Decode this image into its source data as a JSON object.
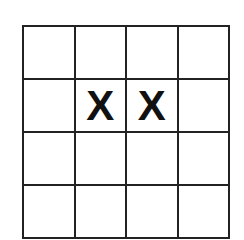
{
  "grid": {
    "rows": 4,
    "cols": 4,
    "line_color": "#222222",
    "cells": [
      [
        "",
        "",
        "",
        ""
      ],
      [
        "",
        "X",
        "X",
        ""
      ],
      [
        "",
        "",
        "",
        ""
      ],
      [
        "",
        "",
        "",
        ""
      ]
    ]
  }
}
